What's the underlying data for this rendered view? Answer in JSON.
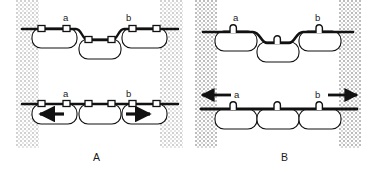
{
  "figure": {
    "width": 378,
    "height": 172,
    "background_color": "#ffffff",
    "ink_color": "#111111",
    "stipple_color": "#c9c9c9",
    "caption_note": "Two-panel schematic of epithelial cell junctions under tension"
  },
  "panels": [
    {
      "id": "A",
      "label": "A",
      "label_x": 93,
      "label_y": 152,
      "bands": [
        {
          "name": "left-stipple-band",
          "x": 16,
          "y": 0,
          "width": 23,
          "height": 148,
          "style": "soft"
        },
        {
          "name": "right-stipple-band",
          "x": 160,
          "y": 0,
          "width": 23,
          "height": 148,
          "style": "soft"
        }
      ],
      "rows": [
        {
          "id": "relaxed",
          "name": "upper-row",
          "membrane": "wavy",
          "junction_style": "rectangular-plaque",
          "arrows": [],
          "site_labels": [
            {
              "text": "a",
              "x": 63,
              "y": 13
            },
            {
              "text": "b",
              "x": 126,
              "y": 13
            }
          ],
          "cells": [
            {
              "name": "cell-left",
              "x": 32,
              "y": 28,
              "width": 45,
              "height": 20,
              "offset": 0
            },
            {
              "name": "cell-middle",
              "x": 79,
              "y": 39,
              "width": 42,
              "height": 20,
              "offset": 11
            },
            {
              "name": "cell-right",
              "x": 122,
              "y": 28,
              "width": 45,
              "height": 20,
              "offset": 0
            }
          ]
        },
        {
          "id": "contracted",
          "name": "lower-row",
          "membrane": "straight",
          "junction_style": "rectangular-plaque",
          "arrows": [
            {
              "name": "arrow-left",
              "direction": "left",
              "x": 38,
              "y": 113,
              "length": 26,
              "placement": "inside-cell"
            },
            {
              "name": "arrow-right",
              "direction": "right",
              "x": 125,
              "y": 113,
              "length": 26,
              "placement": "inside-cell"
            }
          ],
          "site_labels": [
            {
              "text": "a",
              "x": 63,
              "y": 89
            },
            {
              "text": "b",
              "x": 126,
              "y": 89
            }
          ],
          "cells": [
            {
              "name": "cell-left",
              "x": 32,
              "y": 104,
              "width": 45,
              "height": 20,
              "offset": 0
            },
            {
              "name": "cell-middle",
              "x": 79,
              "y": 104,
              "width": 42,
              "height": 20,
              "offset": 0
            },
            {
              "name": "cell-right",
              "x": 122,
              "y": 104,
              "width": 45,
              "height": 20,
              "offset": 0
            }
          ]
        }
      ]
    },
    {
      "id": "B",
      "label": "B",
      "label_x": 92,
      "label_y": 152,
      "bands": [
        {
          "name": "left-stipple-band",
          "x": 6,
          "y": 0,
          "width": 22,
          "height": 148,
          "style": "normal"
        },
        {
          "name": "right-stipple-band",
          "x": 150,
          "y": 0,
          "width": 22,
          "height": 148,
          "style": "normal"
        }
      ],
      "rows": [
        {
          "id": "relaxed",
          "name": "upper-row",
          "membrane": "wavy",
          "junction_style": "loop-arch",
          "arrows": [],
          "site_labels": [
            {
              "text": "a",
              "x": 44,
              "y": 13
            },
            {
              "text": "b",
              "x": 126,
              "y": 13
            }
          ],
          "cells": [
            {
              "name": "cell-left",
              "x": 26,
              "y": 31,
              "width": 42,
              "height": 20,
              "offset": 0
            },
            {
              "name": "cell-middle",
              "x": 68,
              "y": 42,
              "width": 42,
              "height": 20,
              "offset": 11
            },
            {
              "name": "cell-right",
              "x": 110,
              "y": 31,
              "width": 42,
              "height": 20,
              "offset": 0
            }
          ]
        },
        {
          "id": "stretched",
          "name": "lower-row",
          "membrane": "straight",
          "junction_style": "loop-arch",
          "arrows": [
            {
              "name": "arrow-left",
              "direction": "left",
              "x": 12,
              "y": 94,
              "length": 30,
              "placement": "outside-above"
            },
            {
              "name": "arrow-right",
              "direction": "right",
              "x": 139,
              "y": 94,
              "length": 30,
              "placement": "outside-above"
            }
          ],
          "site_labels": [
            {
              "text": "a",
              "x": 45,
              "y": 90
            },
            {
              "text": "b",
              "x": 126,
              "y": 90
            }
          ],
          "cells": [
            {
              "name": "cell-left",
              "x": 26,
              "y": 109,
              "width": 42,
              "height": 20,
              "offset": 0
            },
            {
              "name": "cell-middle",
              "x": 68,
              "y": 109,
              "width": 42,
              "height": 20,
              "offset": 0
            },
            {
              "name": "cell-right",
              "x": 110,
              "y": 109,
              "width": 42,
              "height": 20,
              "offset": 0
            }
          ]
        }
      ]
    }
  ]
}
